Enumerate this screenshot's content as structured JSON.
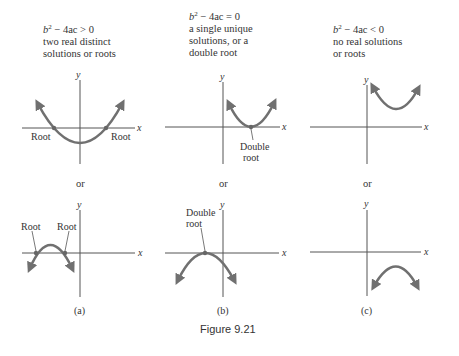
{
  "columns": [
    {
      "condition": "b² − 4ac > 0",
      "cond_b": "b",
      "cond_rest": " − 4ac > 0",
      "desc_lines": [
        "two real distinct",
        "solutions or roots"
      ],
      "top_labels": [
        "Root",
        "Root"
      ],
      "or_label": "or",
      "bottom_labels": [
        "Root",
        "Root"
      ],
      "panel_label": "(a)"
    },
    {
      "condition": "b² − 4ac = 0",
      "cond_b": "b",
      "cond_rest": " − 4ac = 0",
      "desc_lines": [
        "a single unique",
        "solutions, or a",
        "double root"
      ],
      "top_labels": [
        "Double",
        "root"
      ],
      "or_label": "or",
      "bottom_labels": [
        "Double",
        "root"
      ],
      "panel_label": "(b)"
    },
    {
      "condition": "b² − 4ac < 0",
      "cond_b": "b",
      "cond_rest": " − 4ac < 0",
      "desc_lines": [
        "no real solutions",
        "or roots"
      ],
      "top_labels": [],
      "or_label": "or",
      "bottom_labels": [],
      "panel_label": "(c)"
    }
  ],
  "axes": {
    "x_label": "x",
    "y_label": "y",
    "superscript": "2"
  },
  "figure_caption": "Figure 9.21",
  "colors": {
    "curve": "#707070",
    "axis": "#555555",
    "text": "#333333",
    "background": "#ffffff"
  }
}
